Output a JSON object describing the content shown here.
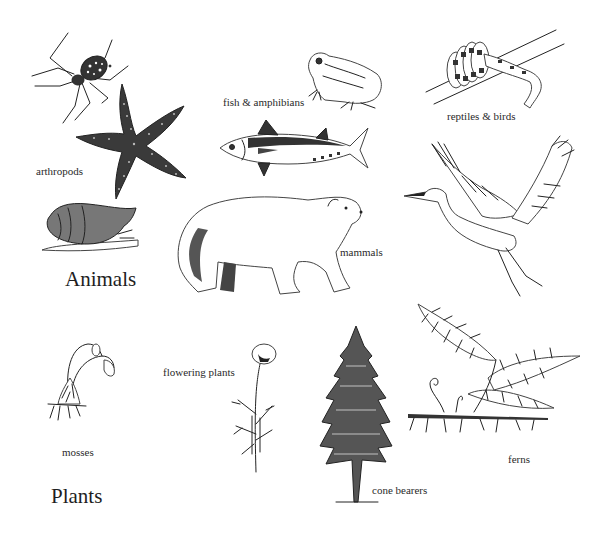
{
  "figure": {
    "background": "#ffffff",
    "ink_color": "#222222"
  },
  "groups": {
    "animals": {
      "heading": "Animals",
      "categories": [
        {
          "id": "arthropods",
          "label": "arthropods",
          "illustrations": [
            "spider",
            "starfish"
          ]
        },
        {
          "id": "fish-amphibians",
          "label": "fish & amphibians",
          "illustrations": [
            "frog",
            "tuna"
          ]
        },
        {
          "id": "reptiles-birds",
          "label": "reptiles & birds",
          "illustrations": [
            "snake",
            "egret"
          ]
        },
        {
          "id": "mammals",
          "label": "mammals",
          "illustrations": [
            "polar-bear"
          ]
        },
        {
          "id": "mollusc",
          "label": "",
          "illustrations": [
            "snail"
          ]
        }
      ]
    },
    "plants": {
      "heading": "Plants",
      "categories": [
        {
          "id": "mosses",
          "label": "mosses",
          "illustrations": [
            "moss"
          ]
        },
        {
          "id": "flowering-plants",
          "label": "flowering plants",
          "illustrations": [
            "poppy"
          ]
        },
        {
          "id": "cone-bearers",
          "label": "cone bearers",
          "illustrations": [
            "conifer"
          ]
        },
        {
          "id": "ferns",
          "label": "ferns",
          "illustrations": [
            "fern"
          ]
        }
      ]
    }
  }
}
